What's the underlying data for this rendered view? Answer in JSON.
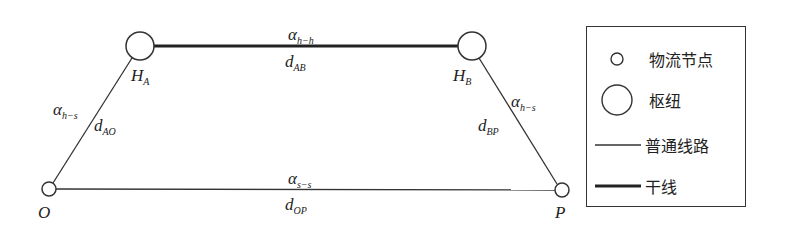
{
  "diagram": {
    "nodes": {
      "HA": {
        "main": "H",
        "sub": "A"
      },
      "HB": {
        "main": "H",
        "sub": "B"
      },
      "O": {
        "main": "O"
      },
      "P": {
        "main": "P"
      }
    },
    "edges": {
      "HA_HB": {
        "alpha": {
          "main": "α",
          "sub": "h−h"
        },
        "dist": {
          "main": "d",
          "sub": "AB"
        }
      },
      "HA_O": {
        "alpha": {
          "main": "α",
          "sub": "h−s"
        },
        "dist": {
          "main": "d",
          "sub": "AO"
        }
      },
      "HB_P": {
        "alpha": {
          "main": "α",
          "sub": "h−s"
        },
        "dist": {
          "main": "d",
          "sub": "BP"
        }
      },
      "O_P": {
        "alpha": {
          "main": "α",
          "sub": "s−s"
        },
        "dist": {
          "main": "d",
          "sub": "OP"
        }
      }
    }
  },
  "legend": {
    "items": [
      {
        "symbol": "small-circle",
        "label": "物流节点"
      },
      {
        "symbol": "large-circle",
        "label": "枢纽"
      },
      {
        "symbol": "thin-line",
        "label": "普通线路"
      },
      {
        "symbol": "thick-line",
        "label": "干线"
      }
    ]
  }
}
